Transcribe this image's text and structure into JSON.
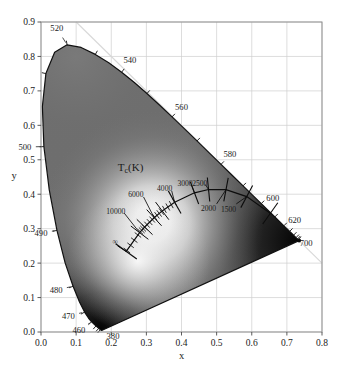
{
  "figure": {
    "kind": "cie-1931-chromaticity-diagram",
    "background_color": "#ffffff",
    "frame_color": "#8f8f8f",
    "grid_color": "#cfcfcf",
    "locus_color": "#111111",
    "mix_line_color": "#d8d8d8"
  },
  "chart_data": {
    "type": "scatter",
    "title": "",
    "xlabel": "x",
    "ylabel": "y",
    "xlim": [
      0.0,
      0.8
    ],
    "ylim": [
      0.0,
      0.9
    ],
    "grid": true,
    "legend": null,
    "xticks": [
      "0.0",
      "0.1",
      "0.2",
      "0.3",
      "0.4",
      "0.5",
      "0.6",
      "0.7",
      "0.8"
    ],
    "xtick_values": [
      0.0,
      0.1,
      0.2,
      0.3,
      0.4,
      0.5,
      0.6,
      0.7,
      0.8
    ],
    "yticks": [
      "0.0",
      "0.1",
      "0.2",
      "0.3",
      "0.4",
      "0.5",
      "0.6",
      "0.7",
      "0.8",
      "0.9"
    ],
    "ytick_values": [
      0.0,
      0.1,
      0.2,
      0.3,
      0.4,
      0.5,
      0.6,
      0.7,
      0.8,
      0.9
    ],
    "annotation_group_label": "T_c(K)",
    "wavelength_labels": [
      {
        "text": "380",
        "nm": 380,
        "x": 0.1741,
        "y": 0.005,
        "lx": 0.205,
        "ly": -0.012
      },
      {
        "text": "460",
        "nm": 460,
        "x": 0.144,
        "y": 0.0297,
        "lx": 0.108,
        "ly": 0.006
      },
      {
        "text": "470",
        "nm": 470,
        "x": 0.1241,
        "y": 0.0578,
        "lx": 0.078,
        "ly": 0.047
      },
      {
        "text": "480",
        "nm": 480,
        "x": 0.0913,
        "y": 0.1327,
        "lx": 0.043,
        "ly": 0.122
      },
      {
        "text": "490",
        "nm": 490,
        "x": 0.0454,
        "y": 0.295,
        "lx": 0.0,
        "ly": 0.288
      },
      {
        "text": "500",
        "nm": 500,
        "x": 0.0082,
        "y": 0.5384,
        "lx": -0.046,
        "ly": 0.537
      },
      {
        "text": "520",
        "nm": 520,
        "x": 0.0743,
        "y": 0.8338,
        "lx": 0.045,
        "ly": 0.882
      },
      {
        "text": "540",
        "nm": 540,
        "x": 0.2296,
        "y": 0.7543,
        "lx": 0.253,
        "ly": 0.79
      },
      {
        "text": "560",
        "nm": 560,
        "x": 0.3731,
        "y": 0.6245,
        "lx": 0.4,
        "ly": 0.654
      },
      {
        "text": "580",
        "nm": 580,
        "x": 0.5125,
        "y": 0.4866,
        "lx": 0.538,
        "ly": 0.518
      },
      {
        "text": "600",
        "nm": 600,
        "x": 0.627,
        "y": 0.3725,
        "lx": 0.66,
        "ly": 0.39
      },
      {
        "text": "620",
        "nm": 620,
        "x": 0.6915,
        "y": 0.3083,
        "lx": 0.722,
        "ly": 0.325
      },
      {
        "text": "700",
        "nm": 700,
        "x": 0.7347,
        "y": 0.2653,
        "lx": 0.755,
        "ly": 0.258
      }
    ],
    "color_temperature_labels": [
      {
        "text": "∞",
        "kelvin": null,
        "lx": 0.211,
        "ly": 0.263
      },
      {
        "text": "10000",
        "kelvin": 10000,
        "lx": 0.213,
        "ly": 0.352
      },
      {
        "text": "6000",
        "kelvin": 6000,
        "lx": 0.27,
        "ly": 0.4
      },
      {
        "text": "4000",
        "kelvin": 4000,
        "lx": 0.352,
        "ly": 0.417
      },
      {
        "text": "3000",
        "kelvin": 3000,
        "lx": 0.41,
        "ly": 0.434
      },
      {
        "text": "2500",
        "kelvin": 2500,
        "lx": 0.452,
        "ly": 0.434
      },
      {
        "text": "2000",
        "kelvin": 2000,
        "lx": 0.477,
        "ly": 0.359
      },
      {
        "text": "1500",
        "kelvin": 1500,
        "lx": 0.534,
        "ly": 0.358
      }
    ],
    "planckian_locus": [
      {
        "kelvin": 1000,
        "x": 0.6528,
        "y": 0.3444
      },
      {
        "kelvin": 1500,
        "x": 0.5857,
        "y": 0.3931
      },
      {
        "kelvin": 2000,
        "x": 0.5267,
        "y": 0.4133
      },
      {
        "kelvin": 2500,
        "x": 0.477,
        "y": 0.4137
      },
      {
        "kelvin": 3000,
        "x": 0.4369,
        "y": 0.4041
      },
      {
        "kelvin": 4000,
        "x": 0.3805,
        "y": 0.3768
      },
      {
        "kelvin": 5000,
        "x": 0.3451,
        "y": 0.3516
      },
      {
        "kelvin": 6000,
        "x": 0.3221,
        "y": 0.3318
      },
      {
        "kelvin": 8000,
        "x": 0.2952,
        "y": 0.3048
      },
      {
        "kelvin": 10000,
        "x": 0.2807,
        "y": 0.2884
      },
      {
        "kelvin": 100000,
        "x": 0.2426,
        "y": 0.234
      }
    ],
    "spectral_locus": [
      [
        0.1741,
        0.005
      ],
      [
        0.174,
        0.005
      ],
      [
        0.1738,
        0.0049
      ],
      [
        0.1736,
        0.0049
      ],
      [
        0.1733,
        0.0048
      ],
      [
        0.173,
        0.0048
      ],
      [
        0.1726,
        0.0048
      ],
      [
        0.1721,
        0.0048
      ],
      [
        0.1714,
        0.0051
      ],
      [
        0.1703,
        0.0058
      ],
      [
        0.1689,
        0.0069
      ],
      [
        0.1669,
        0.0086
      ],
      [
        0.1644,
        0.0109
      ],
      [
        0.1611,
        0.0138
      ],
      [
        0.1566,
        0.0177
      ],
      [
        0.151,
        0.0227
      ],
      [
        0.144,
        0.0297
      ],
      [
        0.1355,
        0.0399
      ],
      [
        0.1241,
        0.0578
      ],
      [
        0.1096,
        0.0868
      ],
      [
        0.0913,
        0.1327
      ],
      [
        0.0687,
        0.2007
      ],
      [
        0.0454,
        0.295
      ],
      [
        0.0235,
        0.4127
      ],
      [
        0.0082,
        0.5384
      ],
      [
        0.0039,
        0.6548
      ],
      [
        0.0139,
        0.7502
      ],
      [
        0.0389,
        0.812
      ],
      [
        0.0743,
        0.8338
      ],
      [
        0.1142,
        0.8262
      ],
      [
        0.1547,
        0.8059
      ],
      [
        0.1929,
        0.7816
      ],
      [
        0.2296,
        0.7543
      ],
      [
        0.2658,
        0.7243
      ],
      [
        0.3016,
        0.6923
      ],
      [
        0.3373,
        0.6589
      ],
      [
        0.3731,
        0.6245
      ],
      [
        0.4087,
        0.5896
      ],
      [
        0.4441,
        0.5547
      ],
      [
        0.4788,
        0.5202
      ],
      [
        0.5125,
        0.4866
      ],
      [
        0.5448,
        0.4544
      ],
      [
        0.5752,
        0.4242
      ],
      [
        0.6029,
        0.3965
      ],
      [
        0.627,
        0.3725
      ],
      [
        0.6482,
        0.3514
      ],
      [
        0.6658,
        0.334
      ],
      [
        0.6801,
        0.3197
      ],
      [
        0.6915,
        0.3083
      ],
      [
        0.7006,
        0.2993
      ],
      [
        0.7079,
        0.292
      ],
      [
        0.714,
        0.2859
      ],
      [
        0.719,
        0.2809
      ],
      [
        0.723,
        0.277
      ],
      [
        0.726,
        0.274
      ],
      [
        0.7283,
        0.2717
      ],
      [
        0.73,
        0.27
      ],
      [
        0.7311,
        0.2689
      ],
      [
        0.732,
        0.268
      ],
      [
        0.7327,
        0.2673
      ],
      [
        0.7334,
        0.2666
      ],
      [
        0.734,
        0.266
      ],
      [
        0.7344,
        0.2656
      ],
      [
        0.7346,
        0.2654
      ],
      [
        0.7347,
        0.2653
      ]
    ]
  }
}
